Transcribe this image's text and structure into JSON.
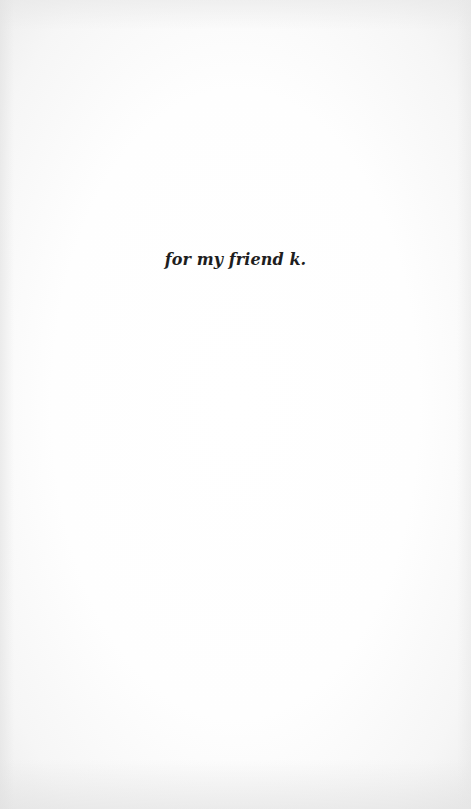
{
  "page": {
    "type": "dedication",
    "dedication_text": "for my friend k.",
    "colors": {
      "paper": "#fdfdfd",
      "text": "#1e1e1e"
    }
  }
}
